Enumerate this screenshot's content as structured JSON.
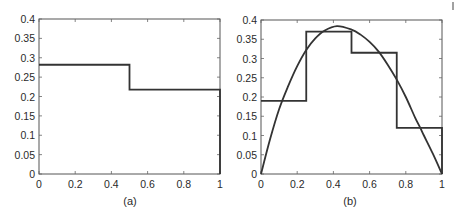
{
  "chart_data": [
    {
      "type": "line",
      "panel": "a",
      "caption": "(a)",
      "title": "",
      "xlabel": "",
      "ylabel": "",
      "xlim": [
        0,
        1
      ],
      "ylim": [
        0,
        0.4
      ],
      "grid": false,
      "x_ticks": [
        "0",
        "0.2",
        "0.4",
        "0.6",
        "0.8",
        "1"
      ],
      "y_ticks": [
        "0",
        "0.05",
        "0.1",
        "0.15",
        "0.2",
        "0.25",
        "0.3",
        "0.35",
        "0.4"
      ],
      "series": [
        {
          "name": "piecewise-constant",
          "style": "step",
          "bins": [
            {
              "x0": 0,
              "x1": 0.5,
              "y": 0.282
            },
            {
              "x0": 0.5,
              "x1": 1,
              "y": 0.218
            }
          ]
        }
      ]
    },
    {
      "type": "line",
      "panel": "b",
      "caption": "(b)",
      "title": "",
      "xlabel": "",
      "ylabel": "",
      "xlim": [
        0,
        1
      ],
      "ylim": [
        0,
        0.4
      ],
      "grid": false,
      "x_ticks": [
        "0",
        "0.2",
        "0.4",
        "0.6",
        "0.8",
        "1"
      ],
      "y_ticks": [
        "0",
        "0.05",
        "0.1",
        "0.15",
        "0.2",
        "0.25",
        "0.3",
        "0.35",
        "0.4"
      ],
      "series": [
        {
          "name": "piecewise-constant",
          "style": "step",
          "bins": [
            {
              "x0": 0,
              "x1": 0.25,
              "y": 0.19
            },
            {
              "x0": 0.25,
              "x1": 0.5,
              "y": 0.37
            },
            {
              "x0": 0.5,
              "x1": 0.75,
              "y": 0.315
            },
            {
              "x0": 0.75,
              "x1": 1,
              "y": 0.12
            }
          ]
        },
        {
          "name": "continuous-curve",
          "style": "curve",
          "x": [
            0,
            0.05,
            0.1,
            0.15,
            0.2,
            0.25,
            0.3,
            0.35,
            0.42,
            0.5,
            0.55,
            0.6,
            0.65,
            0.7,
            0.75,
            0.8,
            0.85,
            0.88,
            0.9,
            0.95,
            1.0
          ],
          "y": [
            0,
            0.09,
            0.168,
            0.228,
            0.28,
            0.322,
            0.352,
            0.372,
            0.384,
            0.375,
            0.362,
            0.343,
            0.318,
            0.284,
            0.245,
            0.2,
            0.148,
            0.12,
            0.1,
            0.052,
            0
          ]
        }
      ]
    }
  ],
  "page_marker": "|"
}
